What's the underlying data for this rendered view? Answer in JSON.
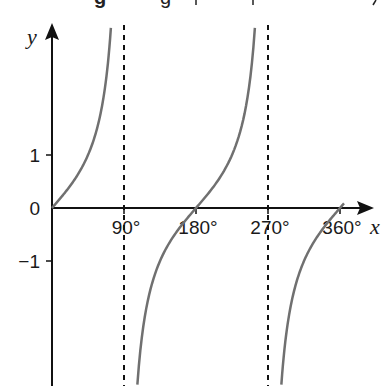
{
  "chart_data": {
    "type": "line",
    "title": "",
    "function": "y = tan x",
    "xlabel": "x",
    "ylabel": "y",
    "x_unit": "degrees",
    "xlim": [
      0,
      380
    ],
    "ylim": [
      -3.4,
      3.4
    ],
    "x_ticks": [
      {
        "value": 90,
        "label": "90°"
      },
      {
        "value": 180,
        "label": "180°"
      },
      {
        "value": 270,
        "label": "270°"
      },
      {
        "value": 360,
        "label": "360°"
      }
    ],
    "y_ticks": [
      {
        "value": 1,
        "label": "1"
      },
      {
        "value": 0,
        "label": "0"
      },
      {
        "value": -1,
        "label": "−1"
      }
    ],
    "asymptotes": [
      90,
      270
    ],
    "series": [
      {
        "name": "tan x",
        "color": "#707070",
        "x": [
          0,
          30,
          45,
          60,
          70,
          73.6
        ],
        "y": [
          0,
          0.577,
          1,
          1.732,
          2.747,
          3.4
        ]
      },
      {
        "name": "tan x",
        "color": "#707070",
        "x": [
          106.7,
          120,
          135,
          180,
          225,
          240,
          253.6
        ],
        "y": [
          -3.34,
          -1.732,
          -1,
          0,
          1,
          1.732,
          3.4
        ]
      },
      {
        "name": "tan x",
        "color": "#707070",
        "x": [
          286.7,
          300,
          315,
          345,
          360,
          365
        ],
        "y": [
          -3.34,
          -1.732,
          -1,
          -0.268,
          0,
          0.087
        ]
      }
    ],
    "grid": false,
    "legend": null
  },
  "colors": {
    "axis": "#111111",
    "curve": "#707070",
    "asymptote": "#111111"
  }
}
